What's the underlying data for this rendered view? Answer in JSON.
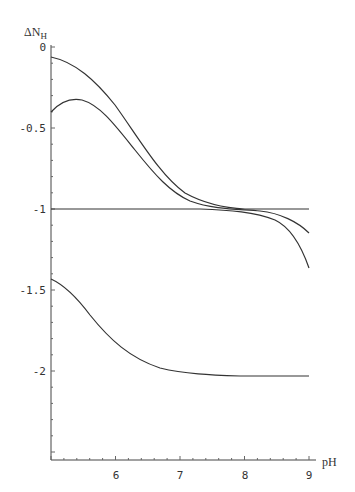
{
  "chart_data": {
    "type": "line",
    "title": "",
    "xlabel": "pH",
    "ylabel": "ΔN_H",
    "ylabel_main": "ΔN",
    "ylabel_sub": "H",
    "xlim": [
      5,
      9
    ],
    "ylim": [
      -2.55,
      0
    ],
    "grid": false,
    "legend": null,
    "x_ticks": [
      6,
      7,
      8,
      9
    ],
    "x_tick_labels": [
      "6",
      "7",
      "8",
      "9"
    ],
    "y_ticks": [
      0,
      -0.5,
      -1,
      -1.5,
      -2
    ],
    "y_tick_labels": [
      "0",
      "-0.5",
      "-1",
      "-1.5",
      "-2"
    ],
    "x": [
      5.0,
      5.5,
      6.0,
      6.5,
      7.0,
      7.5,
      8.0,
      8.5,
      9.0
    ],
    "series": [
      {
        "name": "curve-1",
        "values": [
          -0.06,
          -0.22,
          -0.52,
          -0.8,
          -0.93,
          -0.98,
          -1.0,
          -1.0,
          -1.0
        ]
      },
      {
        "name": "curve-2",
        "values": [
          -0.4,
          -0.33,
          -0.53,
          -0.81,
          -0.94,
          -0.98,
          -1.0,
          -1.04,
          -1.15
        ]
      },
      {
        "name": "curve-3",
        "values": [
          -1.0,
          -1.0,
          -1.0,
          -1.0,
          -1.0,
          -1.01,
          -1.03,
          -1.12,
          -1.36
        ]
      },
      {
        "name": "curve-4",
        "values": [
          -1.42,
          -1.52,
          -1.72,
          -1.89,
          -1.96,
          -1.99,
          -2.0,
          -2.0,
          -2.0
        ]
      }
    ]
  },
  "labels": {
    "y_axis_main": "ΔN",
    "y_axis_sub": "H",
    "x_axis": "pH",
    "y_ticks": [
      "0",
      "-0.5",
      "-1",
      "-1.5",
      "-2"
    ],
    "x_ticks": [
      "6",
      "7",
      "8",
      "9"
    ]
  }
}
